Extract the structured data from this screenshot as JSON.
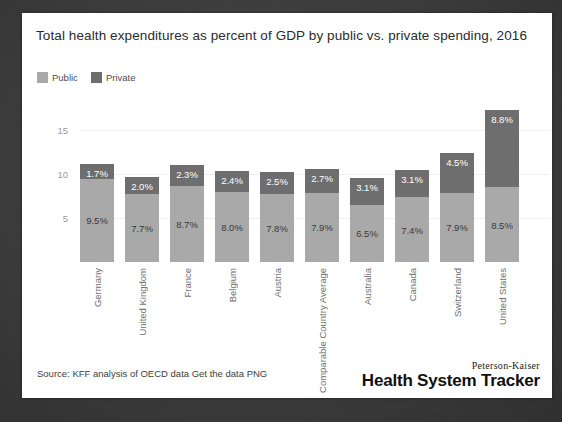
{
  "card": {
    "title": "Total health expenditures as percent of GDP by public vs. private spending, 2016",
    "source_text": "Source: KFF analysis of OECD data  Get the data  PNG",
    "logo_top": "Peterson-Kaiser",
    "logo_main": "Health System Tracker"
  },
  "colors": {
    "public": "#a9a9a9",
    "private": "#6e6e6e",
    "card_background": "#ffffff",
    "page_background": "#3f3f3f",
    "gridline": "#efefef",
    "axis_text": "#9a9a9a"
  },
  "chart_data": {
    "type": "bar",
    "subtype": "stacked-vertical",
    "title": "Total health expenditures as percent of GDP by public vs. private spending, 2016",
    "xlabel": "",
    "ylabel": "",
    "ylim": [
      0,
      18
    ],
    "yticks": [
      5,
      10,
      15
    ],
    "ytick_labels": [
      "5",
      "10",
      "15"
    ],
    "grid": true,
    "legend_position": "top-left",
    "categories": [
      "Germany",
      "United Kingdom",
      "France",
      "Belgium",
      "Austria",
      "Comparable Country Average",
      "Australia",
      "Canada",
      "Switzerland",
      "United States"
    ],
    "series": [
      {
        "name": "Public",
        "color": "#a9a9a9",
        "values": [
          9.5,
          7.7,
          8.7,
          8.0,
          7.8,
          7.9,
          6.5,
          7.4,
          7.9,
          8.5
        ],
        "labels": [
          "9.5%",
          "7.7%",
          "8.7%",
          "8.0%",
          "7.8%",
          "7.9%",
          "6.5%",
          "7.4%",
          "7.9%",
          "8.5%"
        ]
      },
      {
        "name": "Private",
        "color": "#6e6e6e",
        "values": [
          1.7,
          2.0,
          2.3,
          2.4,
          2.5,
          2.7,
          3.1,
          3.1,
          4.5,
          8.8
        ],
        "labels": [
          "1.7%",
          "2.0%",
          "2.3%",
          "2.4%",
          "2.5%",
          "2.7%",
          "3.1%",
          "3.1%",
          "4.5%",
          "8.8%"
        ]
      }
    ],
    "totals": [
      11.2,
      9.7,
      11.0,
      10.4,
      10.3,
      10.6,
      9.6,
      10.5,
      12.4,
      17.3
    ]
  }
}
